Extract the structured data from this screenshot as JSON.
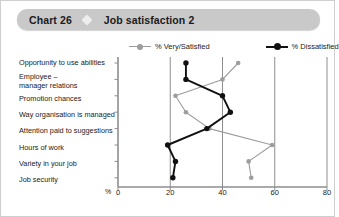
{
  "header": {
    "chart_number": "Chart 26",
    "icon": "diamond-icon",
    "title": "Job satisfaction 2"
  },
  "legend": [
    {
      "label": "% Very/Satisfied",
      "color": "#9d9d9d",
      "marker": "circle"
    },
    {
      "label": "% Dissatisfied",
      "color": "#111111",
      "marker": "circle"
    }
  ],
  "axis": {
    "unit": "%",
    "ticks": [
      "0",
      "20",
      "40",
      "60",
      "80"
    ]
  },
  "chart_data": {
    "type": "line",
    "orientation": "horizontal",
    "title": "Job satisfaction 2",
    "xlabel": "%",
    "ylabel": "",
    "xlim": [
      0,
      80
    ],
    "xticks": [
      0,
      20,
      40,
      60,
      80
    ],
    "grid": true,
    "legend_position": "top",
    "categories": [
      "Opportunity to use abilities",
      "Employee – manager relations",
      "Promotion chances",
      "Way organisation is managed",
      "Attention paid to suggestions",
      "Hours of work",
      "Variety in your job",
      "Job security"
    ],
    "series": [
      {
        "name": "% Very/Satisfied",
        "color": "#9d9d9d",
        "values": [
          46,
          40,
          22,
          26,
          35,
          59,
          50,
          51
        ]
      },
      {
        "name": "% Dissatisfied",
        "color": "#111111",
        "values": [
          26,
          26,
          40,
          43,
          34,
          19,
          22,
          21
        ]
      }
    ]
  }
}
